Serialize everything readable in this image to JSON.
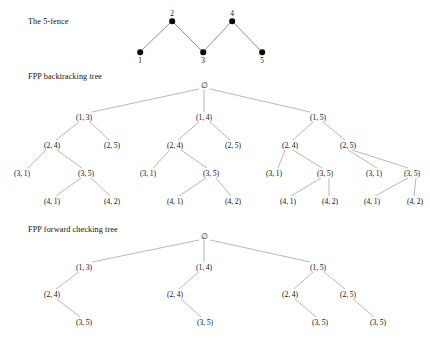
{
  "figure": {
    "width": 430,
    "height": 347,
    "background": "#ffffff",
    "ink_color": "#111111",
    "edge_color": "#8a8a8a"
  },
  "sections": [
    {
      "id": "fence",
      "caption": "The 5-fence",
      "caption_x": 28,
      "caption_y": 22
    },
    {
      "id": "backtracking",
      "caption": "FPP backtracking tree",
      "caption_x": 28,
      "caption_y": 77
    },
    {
      "id": "forward_checking",
      "caption": "FPP forward checking tree",
      "caption_x": 28,
      "caption_y": 230
    }
  ],
  "fence": {
    "nodes": [
      {
        "label": "1",
        "x": 140,
        "y": 52,
        "label_x": 140,
        "label_y": 56
      },
      {
        "label": "2",
        "x": 172,
        "y": 21,
        "label_x": 172,
        "label_y": 9
      },
      {
        "label": "3",
        "x": 203,
        "y": 52,
        "label_x": 203,
        "label_y": 56
      },
      {
        "label": "4",
        "x": 232,
        "y": 21,
        "label_x": 232,
        "label_y": 9
      },
      {
        "label": "5",
        "x": 262,
        "y": 52,
        "label_x": 262,
        "label_y": 56
      }
    ],
    "edges": [
      {
        "x1": 140,
        "y1": 52,
        "x2": 172,
        "y2": 21
      },
      {
        "x1": 172,
        "y1": 21,
        "x2": 203,
        "y2": 52
      },
      {
        "x1": 203,
        "y1": 52,
        "x2": 232,
        "y2": 21
      },
      {
        "x1": 232,
        "y1": 21,
        "x2": 262,
        "y2": 52
      }
    ]
  },
  "backtracking_tree": {
    "root": {
      "label": "∅",
      "x": 204,
      "y": 85
    },
    "nodes": [
      {
        "label": "(1, 3)",
        "x": 84,
        "y": 117
      },
      {
        "label": "(1, 4)",
        "x": 204,
        "y": 117
      },
      {
        "label": "(1, 5)",
        "x": 318,
        "y": 117
      },
      {
        "label": "(2, 4)",
        "x": 52,
        "y": 145
      },
      {
        "label": "(2, 5)",
        "x": 112,
        "y": 145
      },
      {
        "label": "(2, 4)",
        "x": 175,
        "y": 145
      },
      {
        "label": "(2, 5)",
        "x": 233,
        "y": 145
      },
      {
        "label": "(2, 4)",
        "x": 290,
        "y": 145
      },
      {
        "label": "(2, 5)",
        "x": 348,
        "y": 145
      },
      {
        "label": "(3, 1)",
        "x": 22,
        "y": 173
      },
      {
        "label": "(3, 5)",
        "x": 86,
        "y": 173
      },
      {
        "label": "(3, 1)",
        "x": 148,
        "y": 173
      },
      {
        "label": "(3, 5)",
        "x": 211,
        "y": 173
      },
      {
        "label": "(3, 1)",
        "x": 274,
        "y": 173
      },
      {
        "label": "(3, 5)",
        "x": 325,
        "y": 173
      },
      {
        "label": "(3, 1)",
        "x": 374,
        "y": 173
      },
      {
        "label": "(3, 5)",
        "x": 412,
        "y": 173
      },
      {
        "label": "(4, 1)",
        "x": 52,
        "y": 201
      },
      {
        "label": "(4, 2)",
        "x": 112,
        "y": 201
      },
      {
        "label": "(4, 1)",
        "x": 175,
        "y": 201
      },
      {
        "label": "(4, 2)",
        "x": 233,
        "y": 201
      },
      {
        "label": "(4, 1)",
        "x": 288,
        "y": 201
      },
      {
        "label": "(4, 2)",
        "x": 330,
        "y": 201
      },
      {
        "label": "(4, 1)",
        "x": 372,
        "y": 201
      },
      {
        "label": "(4, 2)",
        "x": 415,
        "y": 201
      }
    ],
    "edges": [
      {
        "x1": 199,
        "y1": 89,
        "x2": 92,
        "y2": 112
      },
      {
        "x1": 204,
        "y1": 89,
        "x2": 204,
        "y2": 112
      },
      {
        "x1": 210,
        "y1": 89,
        "x2": 310,
        "y2": 112
      },
      {
        "x1": 79,
        "y1": 122,
        "x2": 56,
        "y2": 140
      },
      {
        "x1": 90,
        "y1": 122,
        "x2": 109,
        "y2": 140
      },
      {
        "x1": 199,
        "y1": 122,
        "x2": 178,
        "y2": 140
      },
      {
        "x1": 210,
        "y1": 122,
        "x2": 230,
        "y2": 140
      },
      {
        "x1": 313,
        "y1": 122,
        "x2": 293,
        "y2": 140
      },
      {
        "x1": 323,
        "y1": 122,
        "x2": 345,
        "y2": 140
      },
      {
        "x1": 46,
        "y1": 150,
        "x2": 28,
        "y2": 168
      },
      {
        "x1": 57,
        "y1": 150,
        "x2": 82,
        "y2": 168
      },
      {
        "x1": 170,
        "y1": 150,
        "x2": 153,
        "y2": 168
      },
      {
        "x1": 181,
        "y1": 150,
        "x2": 207,
        "y2": 168
      },
      {
        "x1": 285,
        "y1": 150,
        "x2": 278,
        "y2": 168
      },
      {
        "x1": 293,
        "y1": 150,
        "x2": 322,
        "y2": 168
      },
      {
        "x1": 348,
        "y1": 150,
        "x2": 377,
        "y2": 168
      },
      {
        "x1": 352,
        "y1": 150,
        "x2": 408,
        "y2": 168
      },
      {
        "x1": 81,
        "y1": 178,
        "x2": 56,
        "y2": 196
      },
      {
        "x1": 91,
        "y1": 178,
        "x2": 110,
        "y2": 196
      },
      {
        "x1": 206,
        "y1": 178,
        "x2": 179,
        "y2": 196
      },
      {
        "x1": 216,
        "y1": 178,
        "x2": 231,
        "y2": 196
      },
      {
        "x1": 321,
        "y1": 178,
        "x2": 291,
        "y2": 196
      },
      {
        "x1": 329,
        "y1": 178,
        "x2": 329,
        "y2": 196
      },
      {
        "x1": 408,
        "y1": 178,
        "x2": 375,
        "y2": 196
      },
      {
        "x1": 416,
        "y1": 178,
        "x2": 414,
        "y2": 196
      }
    ]
  },
  "forward_checking_tree": {
    "root": {
      "label": "∅",
      "x": 204,
      "y": 236
    },
    "nodes": [
      {
        "label": "(1, 3)",
        "x": 84,
        "y": 267
      },
      {
        "label": "(1, 4)",
        "x": 204,
        "y": 267
      },
      {
        "label": "(1, 5)",
        "x": 318,
        "y": 267
      },
      {
        "label": "(2, 4)",
        "x": 52,
        "y": 294
      },
      {
        "label": "(2, 4)",
        "x": 175,
        "y": 294
      },
      {
        "label": "(2, 4)",
        "x": 290,
        "y": 294
      },
      {
        "label": "(2, 5)",
        "x": 348,
        "y": 294
      },
      {
        "label": "(3, 5)",
        "x": 84,
        "y": 322
      },
      {
        "label": "(3, 5)",
        "x": 205,
        "y": 322
      },
      {
        "label": "(3, 5)",
        "x": 320,
        "y": 322
      },
      {
        "label": "(3, 5)",
        "x": 378,
        "y": 322
      }
    ],
    "edges": [
      {
        "x1": 199,
        "y1": 240,
        "x2": 92,
        "y2": 262
      },
      {
        "x1": 204,
        "y1": 240,
        "x2": 204,
        "y2": 262
      },
      {
        "x1": 210,
        "y1": 240,
        "x2": 310,
        "y2": 262
      },
      {
        "x1": 79,
        "y1": 272,
        "x2": 56,
        "y2": 289
      },
      {
        "x1": 199,
        "y1": 272,
        "x2": 179,
        "y2": 289
      },
      {
        "x1": 313,
        "y1": 272,
        "x2": 294,
        "y2": 289
      },
      {
        "x1": 324,
        "y1": 272,
        "x2": 345,
        "y2": 289
      },
      {
        "x1": 57,
        "y1": 299,
        "x2": 80,
        "y2": 317
      },
      {
        "x1": 181,
        "y1": 299,
        "x2": 201,
        "y2": 317
      },
      {
        "x1": 295,
        "y1": 299,
        "x2": 316,
        "y2": 317
      },
      {
        "x1": 353,
        "y1": 299,
        "x2": 374,
        "y2": 317
      }
    ]
  }
}
